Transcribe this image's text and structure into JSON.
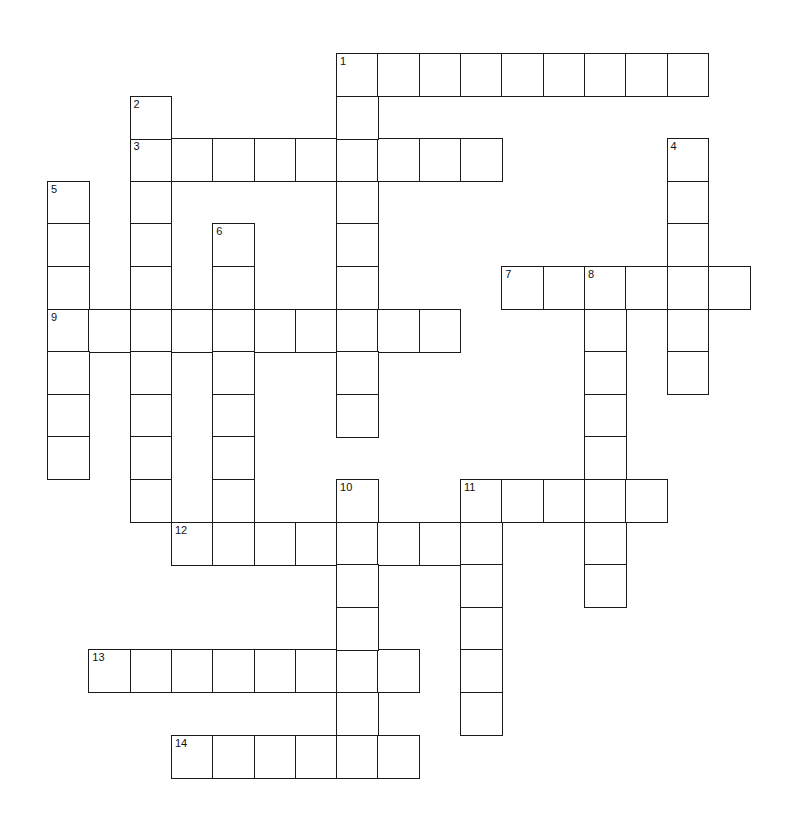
{
  "puzzle": {
    "type": "crossword",
    "grid": {
      "origin_x": 47,
      "origin_y": 53,
      "cell_w": 41.3,
      "cell_h": 42.6
    },
    "colors": {
      "line": "#1a1a1a",
      "background": "#ffffff",
      "label": "#111111"
    },
    "across": [
      {
        "number": "1",
        "col": 7,
        "row": 0,
        "length": 9
      },
      {
        "number": "3",
        "col": 2,
        "row": 2,
        "length": 9
      },
      {
        "number": "7",
        "col": 11,
        "row": 5,
        "length": 6
      },
      {
        "number": "9",
        "col": 0,
        "row": 6,
        "length": 10
      },
      {
        "number": "11",
        "col": 10,
        "row": 10,
        "length": 5
      },
      {
        "number": "12",
        "col": 3,
        "row": 11,
        "length": 8
      },
      {
        "number": "13",
        "col": 1,
        "row": 14,
        "length": 8
      },
      {
        "number": "14",
        "col": 3,
        "row": 16,
        "length": 6
      }
    ],
    "down": [
      {
        "number": "1",
        "col": 7,
        "row": 0,
        "length": 9
      },
      {
        "number": "2",
        "col": 2,
        "row": 1,
        "length": 10
      },
      {
        "number": "4",
        "col": 15,
        "row": 2,
        "length": 6
      },
      {
        "number": "5",
        "col": 0,
        "row": 3,
        "length": 7
      },
      {
        "number": "6",
        "col": 4,
        "row": 4,
        "length": 8
      },
      {
        "number": "8",
        "col": 13,
        "row": 5,
        "length": 8
      },
      {
        "number": "10",
        "col": 7,
        "row": 10,
        "length": 7
      },
      {
        "number": "11",
        "col": 10,
        "row": 10,
        "length": 6
      }
    ]
  }
}
